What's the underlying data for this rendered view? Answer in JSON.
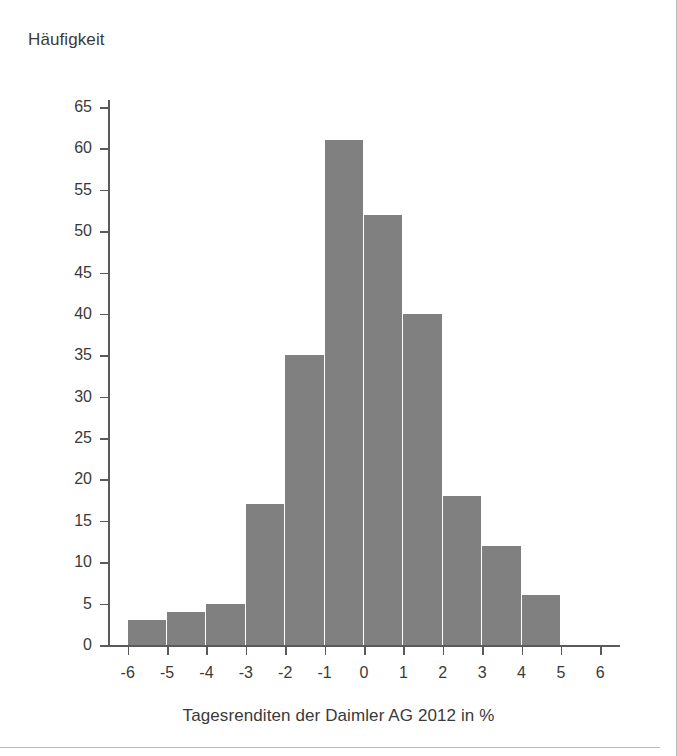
{
  "chart_data": {
    "type": "bar",
    "title": "",
    "xlabel": "Tagesrenditen der Daimler AG 2012 in %",
    "ylabel": "Häufigkeit",
    "bin_width": 1,
    "bin_edges": [
      -6,
      -5,
      -4,
      -3,
      -2,
      -1,
      0,
      1,
      2,
      3,
      4,
      5
    ],
    "categories": [
      "-6 to -5",
      "-5 to -4",
      "-4 to -3",
      "-3 to -2",
      "-2 to -1",
      "-1 to 0",
      "0 to 1",
      "1 to 2",
      "2 to 3",
      "3 to 4",
      "4 to 5"
    ],
    "values": [
      3,
      4,
      5,
      17,
      35,
      61,
      52,
      40,
      18,
      12,
      6
    ],
    "xlim": [
      -6.5,
      6.5
    ],
    "ylim": [
      0,
      68
    ],
    "xticks": [
      -6,
      -5,
      -4,
      -3,
      -2,
      -1,
      0,
      1,
      2,
      3,
      4,
      5,
      6
    ],
    "xtick_labels": [
      "-6",
      "-5",
      "-4",
      "-3",
      "-2",
      "-1",
      "0",
      "1",
      "2",
      "3",
      "4",
      "5",
      "6"
    ],
    "yticks": [
      0,
      5,
      10,
      15,
      20,
      25,
      30,
      35,
      40,
      45,
      50,
      55,
      60,
      65
    ],
    "ytick_labels": [
      "0",
      "5",
      "10",
      "15",
      "20",
      "25",
      "30",
      "35",
      "40",
      "45",
      "50",
      "55",
      "60",
      "65"
    ],
    "grid": false,
    "legend": false,
    "bar_color": "#808080",
    "axis_color": "#5a5a5a",
    "text_color": "#3a3a3a",
    "background": "#ffffff"
  }
}
